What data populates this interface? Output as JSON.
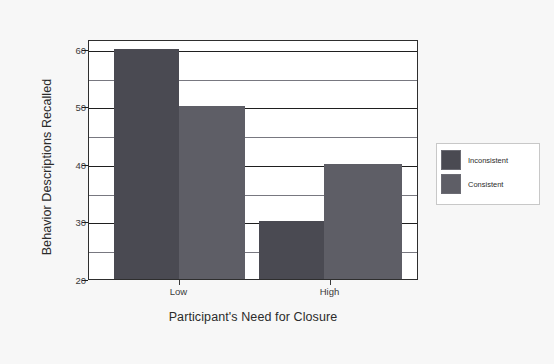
{
  "chart_data": {
    "type": "bar",
    "title": "",
    "subtitle": "",
    "xlabel": "Participant's Need for Closure",
    "ylabel": "Behavior Descriptions Recalled",
    "categories": [
      "Low",
      "High"
    ],
    "series": [
      {
        "name": "Inconsistent",
        "values": [
          60,
          50
        ],
        "color": "#4a4a52"
      },
      {
        "name": "Consistent",
        "values": [
          50,
          40
        ],
        "color": "#5e5e66"
      }
    ],
    "bars": [
      {
        "group": "Low",
        "series": "Inconsistent",
        "value": 60,
        "color": "#4a4a52"
      },
      {
        "group": "Low",
        "series": "Consistent",
        "value": 50,
        "color": "#5e5e66"
      },
      {
        "group": "High",
        "series": "Inconsistent",
        "value": 30,
        "color": "#4a4a52"
      },
      {
        "group": "High",
        "series": "Consistent",
        "value": 40,
        "color": "#5e5e66"
      }
    ],
    "ylim": [
      20,
      61.7
    ],
    "y_major_ticks": [
      20,
      30,
      40,
      50,
      60
    ],
    "y_minor_gridlines": [
      25,
      35,
      45,
      55
    ],
    "y_tick_labels": [
      "20",
      "30",
      "40",
      "50",
      "60"
    ],
    "grid": true,
    "legend_position": "right",
    "legend": [
      "Inconsistent",
      "Consistent"
    ],
    "background_color": "#f7f7f7",
    "plot_background_color": "#ffffff",
    "axis_color": "#2e2e2e"
  },
  "legend": {
    "entries": [
      {
        "label": "Inconsistent",
        "color": "#4a4a52"
      },
      {
        "label": "Consistent",
        "color": "#5e5e66"
      }
    ]
  },
  "axes": {
    "y_title": "Behavior Descriptions Recalled",
    "x_title": "Participant's Need for Closure",
    "y_ticks": [
      "20",
      "30",
      "40",
      "50",
      "60"
    ],
    "x_ticks": [
      "Low",
      "High"
    ]
  }
}
